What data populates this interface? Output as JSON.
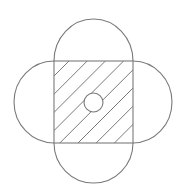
{
  "diagram": {
    "title": "",
    "colors": {
      "background": "#ffffff",
      "line": "#7a7a7a"
    },
    "square": {
      "x": 54,
      "y": 61,
      "width": 79,
      "height": 82
    },
    "semicircles": [
      {
        "side": "top",
        "apex": [
          93.5,
          19
        ]
      },
      {
        "side": "bottom",
        "apex": [
          93.5,
          183
        ]
      },
      {
        "side": "left",
        "apex": [
          14,
          102
        ]
      },
      {
        "side": "right",
        "apex": [
          172,
          102
        ]
      }
    ],
    "center_circle": {
      "cx": 93.5,
      "cy": 102.5,
      "r": 9.5,
      "filled": false
    },
    "hatching": {
      "angle_deg": 45,
      "spacing_px": 18.2,
      "offsets": [
        130,
        148.2,
        166.4,
        184.6,
        202.8,
        221,
        239.2,
        257.4
      ]
    },
    "labels": []
  }
}
